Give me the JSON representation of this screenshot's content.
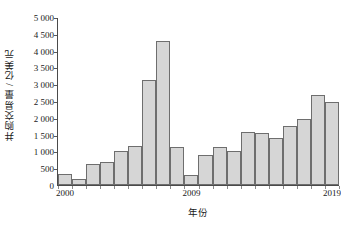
{
  "chart_data": {
    "type": "bar",
    "title": "",
    "xlabel": "年份",
    "ylabel": "并购交易量 / 亿美元",
    "categories": [
      "2000",
      "2001",
      "2002",
      "2003",
      "2004",
      "2005",
      "2006",
      "2007",
      "2008",
      "2009",
      "2010",
      "2011",
      "2012",
      "2013",
      "2014",
      "2015",
      "2016",
      "2017",
      "2018",
      "2019"
    ],
    "values": [
      340,
      190,
      640,
      690,
      1010,
      1180,
      3150,
      4320,
      1130,
      300,
      900,
      1150,
      1010,
      1600,
      1550,
      1400,
      1780,
      1980,
      2700,
      2500
    ],
    "ylim": [
      0,
      5000
    ],
    "yticks": [
      0,
      500,
      1000,
      1500,
      2000,
      2500,
      3000,
      3500,
      4000,
      4500,
      5000
    ],
    "ytick_labels": [
      "0",
      "500",
      "1 000",
      "1 500",
      "2 000",
      "2 500",
      "3 000",
      "3 500",
      "4 000",
      "4 500",
      "5 000"
    ],
    "xtick_positions": [
      "2000",
      "2009",
      "2019"
    ],
    "xtick_labels": [
      "2000",
      "2009",
      "2019"
    ],
    "grid": false,
    "legend": null,
    "bar_fill_color": "#d6d6d6",
    "bar_edge_color": "#6e6e6e",
    "axis_color": "#4a4a4a",
    "background_color": "#ffffff"
  }
}
